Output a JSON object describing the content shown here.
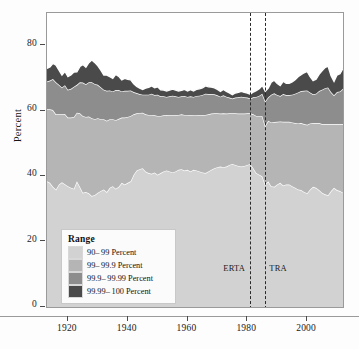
{
  "chart_data": {
    "type": "area",
    "title": "",
    "subtitle": "",
    "xlabel": "",
    "ylabel": "Percent",
    "xlim": [
      1913,
      2012
    ],
    "ylim": [
      0,
      90
    ],
    "grid": false,
    "stacked": true,
    "legend_position": "inside-bottom-left",
    "legend_title": "Range",
    "y_ticks": [
      0,
      20,
      40,
      60,
      80
    ],
    "y_tick_labels": [
      "0",
      "20",
      "40",
      "60",
      "80"
    ],
    "x_ticks": [
      1920,
      1940,
      1960,
      1980,
      2000
    ],
    "x_tick_labels": [
      "1920",
      "1940",
      "1960",
      "1980",
      "2000"
    ],
    "colors": {
      "90-99 Percent": "#d2d2d2",
      "99-99.9 Percent": "#b5b5b5",
      "99.9-99.99 Percent": "#8d8d8d",
      "99.99-100 Percent": "#4a4a4a",
      "boundary_line": "#ffffff",
      "frame": "#9a9a9a",
      "annotation_line": "#2a2a2a"
    },
    "annotations": [
      {
        "label": "ERTA",
        "x": 1981,
        "text_side": "left"
      },
      {
        "label": "TRA",
        "x": 1986,
        "text_side": "right"
      }
    ],
    "x": [
      1913,
      1914,
      1915,
      1916,
      1917,
      1918,
      1919,
      1920,
      1921,
      1922,
      1923,
      1924,
      1925,
      1926,
      1927,
      1928,
      1929,
      1930,
      1931,
      1932,
      1933,
      1934,
      1935,
      1936,
      1937,
      1938,
      1939,
      1940,
      1941,
      1942,
      1943,
      1944,
      1945,
      1946,
      1947,
      1948,
      1949,
      1950,
      1951,
      1952,
      1953,
      1954,
      1955,
      1956,
      1957,
      1958,
      1959,
      1960,
      1961,
      1962,
      1963,
      1964,
      1965,
      1966,
      1967,
      1968,
      1969,
      1970,
      1971,
      1972,
      1973,
      1974,
      1975,
      1976,
      1977,
      1978,
      1979,
      1980,
      1981,
      1982,
      1983,
      1984,
      1985,
      1986,
      1987,
      1988,
      1989,
      1990,
      1991,
      1992,
      1993,
      1994,
      1995,
      1996,
      1997,
      1998,
      1999,
      2000,
      2001,
      2002,
      2003,
      2004,
      2005,
      2006,
      2007,
      2008,
      2009,
      2010,
      2011,
      2012
    ],
    "series": [
      {
        "name": "90-99 Percent",
        "values": [
          38.5,
          38.0,
          36.8,
          36.0,
          37.5,
          38.2,
          37.6,
          37.0,
          36.5,
          36.2,
          38.5,
          36.8,
          35.0,
          35.2,
          34.8,
          34.0,
          34.3,
          35.0,
          35.5,
          36.0,
          35.2,
          36.5,
          37.0,
          36.2,
          36.8,
          38.0,
          37.5,
          38.0,
          38.5,
          40.5,
          41.8,
          42.2,
          42.5,
          41.5,
          41.0,
          40.8,
          41.2,
          40.5,
          41.0,
          41.5,
          41.8,
          41.5,
          41.2,
          41.5,
          42.0,
          42.2,
          41.8,
          42.0,
          41.5,
          42.0,
          41.8,
          41.5,
          41.2,
          41.0,
          41.5,
          42.0,
          42.5,
          42.8,
          43.0,
          42.8,
          43.0,
          43.5,
          43.8,
          43.5,
          43.2,
          43.0,
          43.2,
          43.5,
          43.8,
          42.5,
          41.0,
          40.5,
          40.0,
          37.5,
          38.5,
          37.0,
          36.8,
          37.5,
          38.0,
          37.2,
          37.5,
          37.5,
          37.0,
          36.5,
          36.0,
          35.8,
          35.2,
          34.8,
          36.0,
          36.8,
          36.5,
          35.8,
          35.0,
          34.5,
          34.2,
          35.5,
          36.5,
          35.8,
          35.5,
          35.0
        ]
      },
      {
        "name": "99-99.9 Percent",
        "values": [
          22.0,
          22.5,
          23.5,
          23.0,
          21.5,
          20.8,
          21.5,
          21.0,
          21.5,
          22.0,
          21.0,
          22.5,
          23.5,
          23.0,
          23.5,
          23.8,
          23.2,
          22.8,
          22.0,
          21.5,
          21.8,
          21.0,
          20.5,
          21.0,
          20.8,
          20.0,
          20.5,
          20.2,
          20.0,
          18.5,
          17.5,
          17.2,
          17.0,
          17.5,
          17.8,
          18.0,
          17.5,
          18.0,
          17.5,
          17.2,
          17.0,
          17.2,
          17.5,
          17.2,
          16.8,
          16.8,
          17.0,
          16.8,
          17.2,
          16.8,
          17.0,
          17.2,
          17.5,
          17.8,
          17.5,
          17.2,
          16.8,
          16.5,
          16.2,
          16.5,
          16.2,
          15.8,
          15.5,
          15.8,
          16.0,
          16.2,
          16.0,
          15.8,
          15.5,
          16.5,
          17.5,
          18.0,
          18.5,
          18.0,
          18.5,
          19.5,
          19.8,
          19.2,
          18.8,
          19.5,
          19.2,
          19.2,
          19.5,
          19.8,
          20.2,
          20.5,
          20.8,
          21.0,
          20.2,
          19.5,
          19.8,
          20.5,
          21.0,
          21.5,
          21.8,
          20.5,
          19.5,
          20.2,
          20.5,
          21.0
        ]
      },
      {
        "name": "99.9-99.99 Percent",
        "values": [
          8.5,
          8.8,
          9.5,
          9.8,
          9.0,
          8.2,
          8.8,
          8.5,
          8.8,
          9.2,
          8.5,
          9.5,
          10.2,
          10.0,
          10.5,
          11.0,
          10.8,
          10.2,
          9.8,
          9.0,
          9.2,
          8.8,
          8.5,
          9.2,
          8.8,
          8.0,
          8.2,
          8.0,
          7.8,
          6.8,
          6.2,
          5.8,
          5.5,
          6.0,
          6.2,
          6.5,
          6.2,
          6.5,
          6.0,
          5.8,
          5.5,
          5.8,
          6.0,
          5.8,
          5.5,
          5.5,
          5.8,
          5.5,
          5.8,
          5.5,
          5.8,
          6.0,
          6.2,
          6.5,
          6.2,
          6.0,
          5.8,
          5.5,
          5.2,
          5.5,
          5.2,
          4.8,
          4.5,
          4.8,
          5.0,
          5.2,
          5.0,
          4.8,
          4.5,
          5.2,
          5.8,
          6.2,
          6.8,
          7.5,
          7.2,
          8.5,
          8.8,
          8.2,
          7.8,
          8.5,
          8.2,
          8.2,
          8.5,
          9.0,
          9.5,
          9.8,
          10.2,
          10.5,
          9.5,
          8.8,
          9.0,
          9.8,
          10.5,
          11.0,
          11.2,
          9.8,
          8.8,
          9.8,
          10.0,
          10.8
        ]
      },
      {
        "name": "99.99-100 Percent",
        "values": [
          4.0,
          4.2,
          4.8,
          5.2,
          4.5,
          3.8,
          4.2,
          4.0,
          4.2,
          4.5,
          4.0,
          4.8,
          5.5,
          5.2,
          6.0,
          6.8,
          6.5,
          5.8,
          5.2,
          4.5,
          4.8,
          4.2,
          4.0,
          4.8,
          4.2,
          3.5,
          3.8,
          3.5,
          3.2,
          2.5,
          2.0,
          1.8,
          1.6,
          2.0,
          2.2,
          2.4,
          2.2,
          2.4,
          2.0,
          1.9,
          1.8,
          1.9,
          2.0,
          1.9,
          1.8,
          1.8,
          2.0,
          1.8,
          2.0,
          1.8,
          2.0,
          2.1,
          2.2,
          2.4,
          2.2,
          2.1,
          2.0,
          1.8,
          1.6,
          1.8,
          1.6,
          1.4,
          1.2,
          1.4,
          1.5,
          1.6,
          1.5,
          1.4,
          1.3,
          1.6,
          1.9,
          2.1,
          2.5,
          3.0,
          2.8,
          3.8,
          4.0,
          3.5,
          3.2,
          3.9,
          3.6,
          3.6,
          3.9,
          4.3,
          4.8,
          5.0,
          5.5,
          5.8,
          4.8,
          4.2,
          4.4,
          5.1,
          5.8,
          6.3,
          6.5,
          5.0,
          4.2,
          5.2,
          5.4,
          6.2
        ]
      }
    ]
  },
  "legend": {
    "title": "Range",
    "items": [
      {
        "label": "90– 99 Percent",
        "color": "#d2d2d2"
      },
      {
        "label": "99– 99.9 Percent",
        "color": "#b5b5b5"
      },
      {
        "label": "99.9– 99.99  Percent",
        "color": "#8d8d8d"
      },
      {
        "label": "99.99– 100  Percent",
        "color": "#4a4a4a"
      }
    ]
  },
  "axes": {
    "y_label": "Percent",
    "y_ticks": [
      "0",
      "20",
      "40",
      "60",
      "80"
    ],
    "x_ticks": [
      "1920",
      "1940",
      "1960",
      "1980",
      "2000"
    ]
  },
  "annotations": {
    "erta": "ERTA",
    "tra": "TRA"
  }
}
